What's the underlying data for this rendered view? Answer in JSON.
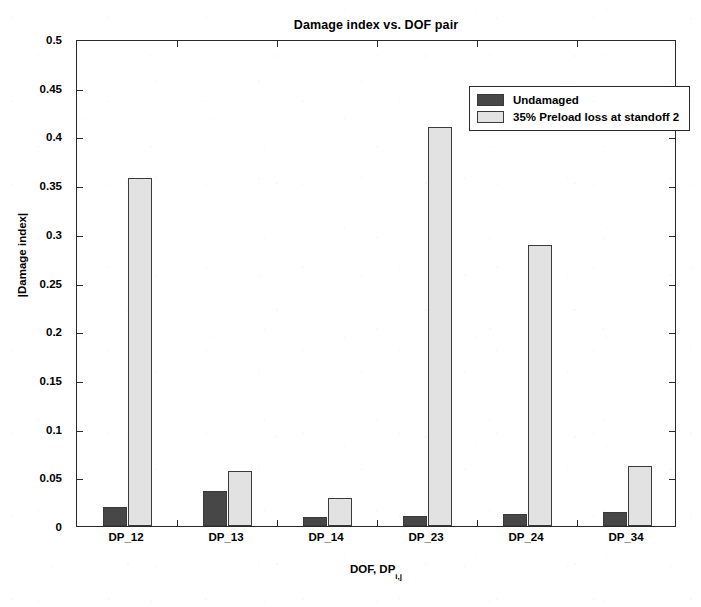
{
  "chart_data": {
    "type": "bar",
    "title": "Damage index vs. DOF pair",
    "xlabel": "DOF, DP",
    "xlabel_subscript": "i,j",
    "ylabel": "|Damage index|",
    "categories": [
      "DP_12",
      "DP_13",
      "DP_14",
      "DP_23",
      "DP_24",
      "DP_34"
    ],
    "series": [
      {
        "name": "Undamaged",
        "color": "#474747",
        "values": [
          0.02,
          0.036,
          0.009,
          0.01,
          0.012,
          0.014
        ]
      },
      {
        "name": "35% Preload loss at standoff 2",
        "color": "#e2e2e2",
        "values": [
          0.357,
          0.056,
          0.029,
          0.41,
          0.289,
          0.062
        ]
      }
    ],
    "ylim": [
      0,
      0.5
    ],
    "ytick_values": [
      0,
      0.05,
      0.1,
      0.15,
      0.2,
      0.25,
      0.3,
      0.35,
      0.4,
      0.45,
      0.5
    ],
    "ytick_labels": [
      "0",
      "0.05",
      "0.1",
      "0.15",
      "0.2",
      "0.25",
      "0.3",
      "0.35",
      "0.4",
      "0.45",
      "0.5"
    ],
    "grid": false,
    "legend_position": "top-right",
    "frame": "box",
    "edge_color": "#3a3a3a"
  },
  "legend": {
    "entries": [
      {
        "label": "Undamaged",
        "swatch_class": "undamaged"
      },
      {
        "label": "35% Preload loss at standoff 2",
        "swatch_class": "preload"
      }
    ]
  }
}
